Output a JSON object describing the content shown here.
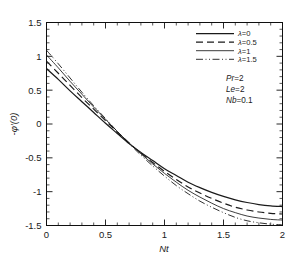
{
  "chart_data": {
    "type": "line",
    "title": "",
    "xlabel": "Nt",
    "ylabel": "-φ′(0)",
    "xlim": [
      0,
      2
    ],
    "ylim": [
      -1.5,
      1.5
    ],
    "grid": false,
    "legend_position": "top-right",
    "xticks": [
      0,
      0.5,
      1,
      1.5,
      2
    ],
    "xtick_labels": [
      "0",
      "0.5",
      "1",
      "1.5",
      "2"
    ],
    "yticks": [
      -1.5,
      -1,
      -0.5,
      0,
      0.5,
      1,
      1.5
    ],
    "ytick_labels": [
      "-1.5",
      "-1",
      "-0.5",
      "0",
      "0.5",
      "1",
      "1.5"
    ],
    "x": [
      0,
      0.1,
      0.2,
      0.3,
      0.4,
      0.5,
      0.6,
      0.7,
      0.8,
      0.9,
      1.0,
      1.1,
      1.2,
      1.3,
      1.4,
      1.5,
      1.6,
      1.7,
      1.8,
      1.9,
      2.0
    ],
    "series": [
      {
        "name": "λ=0",
        "style": "solid",
        "width": 1.25,
        "values": [
          0.82,
          0.66,
          0.49,
          0.33,
          0.17,
          0.01,
          -0.14,
          -0.29,
          -0.42,
          -0.54,
          -0.66,
          -0.76,
          -0.86,
          -0.94,
          -1.01,
          -1.07,
          -1.12,
          -1.16,
          -1.19,
          -1.21,
          -1.22
        ]
      },
      {
        "name": "λ=0.5",
        "style": "dashed",
        "width": 1.15,
        "values": [
          0.93,
          0.75,
          0.57,
          0.39,
          0.22,
          0.05,
          -0.12,
          -0.28,
          -0.43,
          -0.57,
          -0.7,
          -0.82,
          -0.93,
          -1.02,
          -1.1,
          -1.17,
          -1.23,
          -1.27,
          -1.3,
          -1.32,
          -1.33
        ]
      },
      {
        "name": "λ=1",
        "style": "solid-thin",
        "width": 0.85,
        "values": [
          1.02,
          0.83,
          0.63,
          0.44,
          0.25,
          0.07,
          -0.11,
          -0.28,
          -0.44,
          -0.59,
          -0.73,
          -0.86,
          -0.98,
          -1.08,
          -1.17,
          -1.25,
          -1.31,
          -1.36,
          -1.39,
          -1.41,
          -1.42
        ]
      },
      {
        "name": "λ=1.5",
        "style": "dashdotdot",
        "width": 0.9,
        "values": [
          1.09,
          0.89,
          0.68,
          0.47,
          0.27,
          0.08,
          -0.11,
          -0.29,
          -0.46,
          -0.62,
          -0.77,
          -0.91,
          -1.03,
          -1.14,
          -1.23,
          -1.31,
          -1.38,
          -1.43,
          -1.46,
          -1.48,
          -1.49
        ]
      }
    ],
    "annotations": [
      {
        "text": "Pr",
        "value": "=2"
      },
      {
        "text": "Le",
        "value": "=2"
      },
      {
        "text": "Nb",
        "value": "=0.1"
      }
    ]
  },
  "legend": {
    "entries": [
      {
        "symbol": "λ",
        "label": "=0"
      },
      {
        "symbol": "λ",
        "label": "=0.5"
      },
      {
        "symbol": "λ",
        "label": "=1"
      },
      {
        "symbol": "λ",
        "label": "=1.5"
      }
    ]
  }
}
